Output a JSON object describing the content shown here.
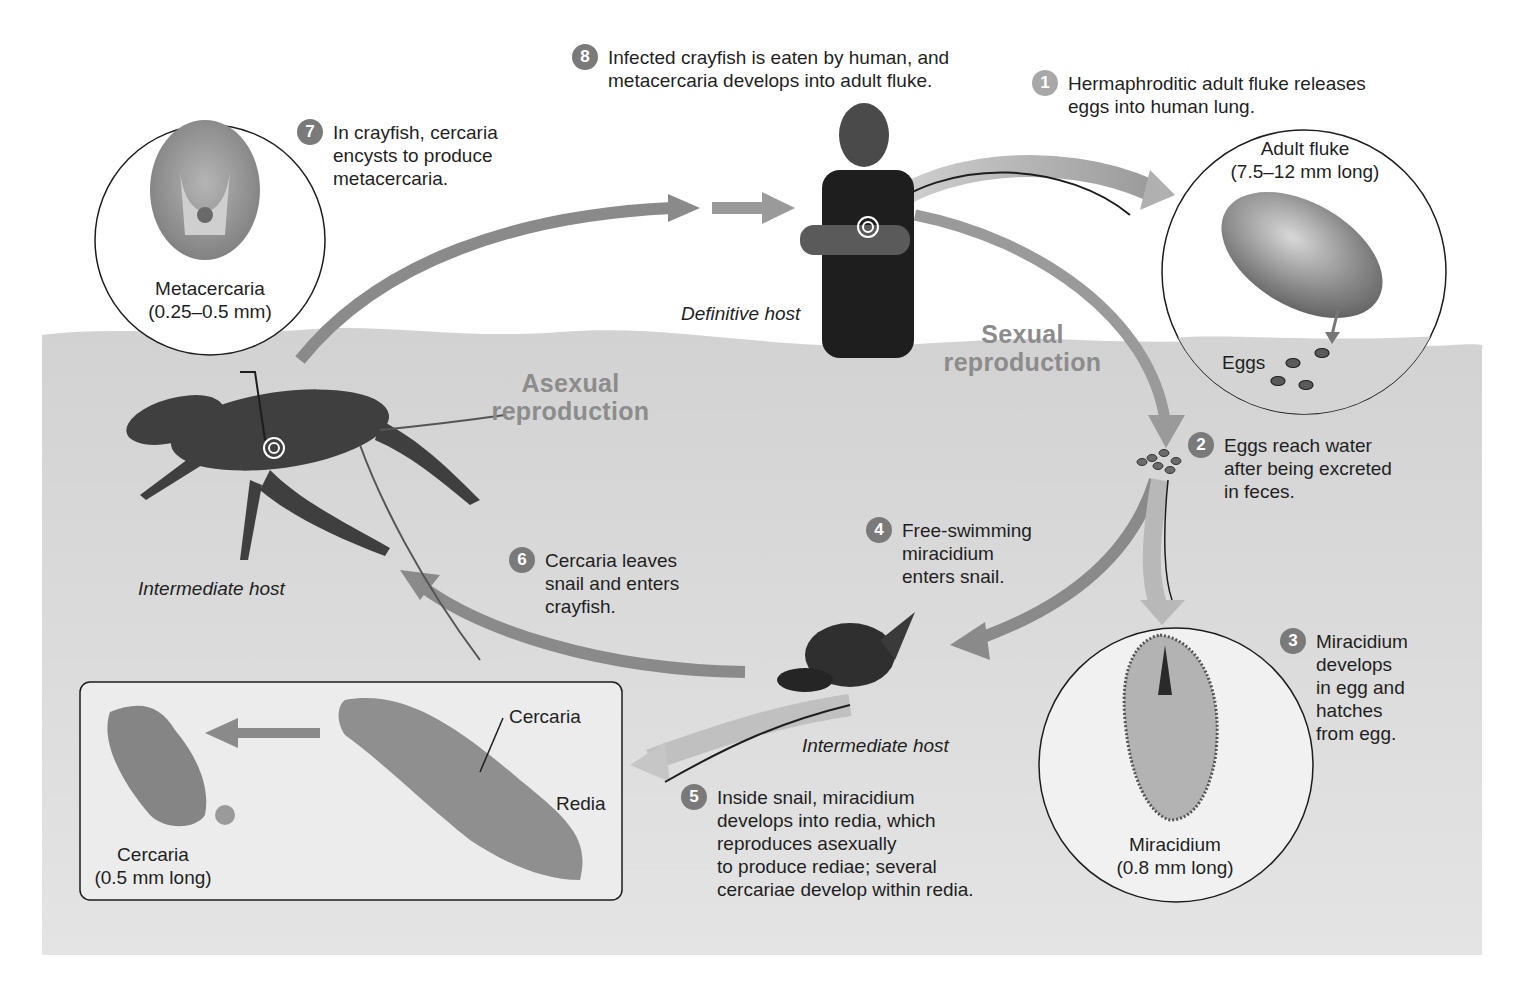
{
  "diagram": {
    "phases": {
      "sexual": "Sexual\nreproduction",
      "asexual": "Asexual\nreproduction"
    },
    "hosts": {
      "definitive": "Definitive host",
      "intermediate_crayfish": "Intermediate host",
      "intermediate_snail": "Intermediate host"
    },
    "steps": [
      {
        "number": "1",
        "text": "Hermaphroditic adult fluke releases\neggs into human lung."
      },
      {
        "number": "2",
        "text": "Eggs reach water\nafter being excreted\nin feces."
      },
      {
        "number": "3",
        "text": "Miracidium\ndevelops\nin egg and\nhatches\nfrom egg."
      },
      {
        "number": "4",
        "text": "Free-swimming\nmiracidium\nenters snail."
      },
      {
        "number": "5",
        "text": "Inside snail, miracidium\ndevelops into redia, which\nreproduces asexually\nto produce rediae; several\ncercariae develop within redia."
      },
      {
        "number": "6",
        "text": "Cercaria leaves\nsnail and enters\ncrayfish."
      },
      {
        "number": "7",
        "text": "In crayfish, cercaria\nencysts to produce\nmetacercaria."
      },
      {
        "number": "8",
        "text": "Infected crayfish is eaten by human, and\nmetacercaria develops into adult fluke."
      }
    ],
    "insets": {
      "adult_fluke": {
        "label": "Adult fluke",
        "size": "(7.5–12 mm long)",
        "eggs_label": "Eggs"
      },
      "metacercaria": {
        "label": "Metacercaria",
        "size": "(0.25–0.5 mm)"
      },
      "miracidium": {
        "label": "Miracidium",
        "size": "(0.8 mm long)"
      },
      "redia_box": {
        "cercaria_label": "Cercaria",
        "redia_label": "Redia",
        "cercaria_name": "Cercaria",
        "cercaria_size": "(0.5 mm long)"
      }
    },
    "colors": {
      "water": "#d6d6d6",
      "arrow": "#8a8a8a",
      "arrow_light": "#b0b0b0",
      "badge": "#7a7a7a",
      "phase_text": "#8c8c8c"
    }
  }
}
